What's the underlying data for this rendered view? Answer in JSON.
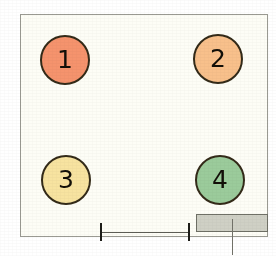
{
  "diagram": {
    "type": "floor-plan-schematic",
    "background_color": "#ffffff",
    "room": {
      "label": "room-outline",
      "fill_color": "#fdfdf6",
      "stroke_color": "#9a9a92",
      "x": 20,
      "y": 14,
      "width": 248,
      "height": 223
    },
    "nodes": [
      {
        "id": 1,
        "label": "1",
        "name": "node-circle-1",
        "fill_color": "#f5936d",
        "stroke_color": "#332a18",
        "cx": 65,
        "cy": 60,
        "r": 25
      },
      {
        "id": 2,
        "label": "2",
        "name": "node-circle-2",
        "fill_color": "#f8c08b",
        "stroke_color": "#332a18",
        "cx": 218,
        "cy": 59,
        "r": 25
      },
      {
        "id": 3,
        "label": "3",
        "name": "node-circle-3",
        "fill_color": "#f7e3a0",
        "stroke_color": "#332a18",
        "cx": 66,
        "cy": 180,
        "r": 25
      },
      {
        "id": 4,
        "label": "4",
        "name": "node-circle-4",
        "fill_color": "#9bcb9b",
        "stroke_color": "#332a18",
        "cx": 220,
        "cy": 180,
        "r": 25
      }
    ],
    "fixture": {
      "name": "fixture-block",
      "fill_color": "#cfd0c5",
      "stroke_color": "#6f7066",
      "x": 196,
      "y": 214,
      "width": 72,
      "height": 18
    },
    "leader": {
      "name": "fixture-leader-line",
      "color": "#73736a",
      "x": 232,
      "y": 219,
      "height": 36
    },
    "dimension": {
      "name": "dimension-line",
      "color": "#5d5d55",
      "tick_color": "#1d1d18",
      "x1": 100,
      "x2": 188,
      "y": 232,
      "tick_height": 18
    }
  }
}
